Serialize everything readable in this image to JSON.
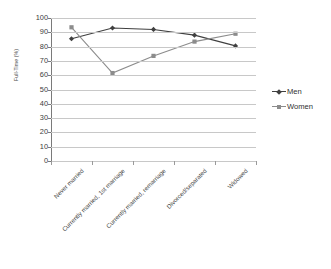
{
  "chart_data": {
    "type": "line",
    "title": "",
    "xlabel": "",
    "ylabel": "Full-Time (%)",
    "ylim": [
      0,
      100
    ],
    "ytick_step": 10,
    "yticks": [
      100,
      90,
      80,
      70,
      60,
      50,
      40,
      30,
      20,
      10,
      0
    ],
    "grid": true,
    "legend_position": "right",
    "categories": [
      "Never married",
      "Currently married, 1st marriage",
      "Currently married, remarriage",
      "Divorced/separated",
      "Widowed"
    ],
    "series": [
      {
        "name": "Men",
        "color": "#3f3f3f",
        "marker": "diamond",
        "values": [
          85.5,
          93.0,
          92.0,
          88.0,
          80.5
        ]
      },
      {
        "name": "Women",
        "color": "#8c8c8c",
        "marker": "square",
        "values": [
          93.5,
          61.5,
          73.5,
          83.5,
          89.0
        ]
      }
    ]
  },
  "axis": {
    "y_title": "Full-Time (%)"
  },
  "legend": {
    "items": [
      {
        "label": "Men"
      },
      {
        "label": "Women"
      }
    ]
  },
  "colors": {
    "men": "#3f3f3f",
    "women": "#8c8c8c",
    "gridline": "#c8c8c8",
    "axis": "#7a7a7a",
    "background": "#ffffff"
  }
}
